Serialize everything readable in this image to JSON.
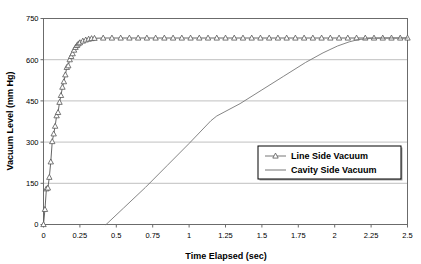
{
  "chart_data": {
    "type": "line",
    "title": "",
    "xlabel": "Time Elapsed (sec)",
    "ylabel": "Vacuum Level (mm Hg)",
    "xlim": [
      0,
      2.5
    ],
    "ylim": [
      0,
      750
    ],
    "xticks": [
      "0",
      "0.25",
      "0.5",
      "0.75",
      "1",
      "1.25",
      "1.5",
      "1.75",
      "2",
      "2.25",
      "2.5"
    ],
    "xtick_values": [
      0,
      0.25,
      0.5,
      0.75,
      1,
      1.25,
      1.5,
      1.75,
      2,
      2.25,
      2.5
    ],
    "yticks": [
      "0",
      "150",
      "300",
      "450",
      "600",
      "750"
    ],
    "ytick_values": [
      0,
      150,
      300,
      450,
      600,
      750
    ],
    "grid": "horizontal",
    "legend_position": "center-right",
    "series": [
      {
        "name": "Line Side Vacuum",
        "marker": "triangle-up",
        "color": "#555555",
        "x": [
          0.0,
          0.01,
          0.02,
          0.03,
          0.04,
          0.05,
          0.06,
          0.07,
          0.08,
          0.09,
          0.1,
          0.11,
          0.12,
          0.13,
          0.14,
          0.15,
          0.16,
          0.17,
          0.18,
          0.19,
          0.2,
          0.21,
          0.22,
          0.23,
          0.24,
          0.25,
          0.27,
          0.29,
          0.31,
          0.33,
          0.35,
          0.41,
          0.47,
          0.53,
          0.59,
          0.65,
          0.71,
          0.77,
          0.83,
          0.89,
          0.95,
          1.01,
          1.07,
          1.13,
          1.19,
          1.25,
          1.31,
          1.37,
          1.43,
          1.49,
          1.55,
          1.61,
          1.67,
          1.73,
          1.79,
          1.85,
          1.91,
          1.97,
          2.03,
          2.09,
          2.15,
          2.21,
          2.27,
          2.33,
          2.39,
          2.45,
          2.5
        ],
        "y": [
          0,
          55,
          130,
          133,
          172,
          228,
          302,
          330,
          358,
          396,
          408,
          445,
          470,
          500,
          520,
          545,
          572,
          578,
          600,
          612,
          622,
          635,
          645,
          652,
          658,
          662,
          668,
          672,
          675,
          677,
          678,
          679,
          679,
          679,
          679,
          679,
          679,
          679,
          679,
          679,
          679,
          679,
          679,
          679,
          679,
          679,
          679,
          679,
          679,
          679,
          679,
          679,
          679,
          679,
          679,
          679,
          679,
          679,
          679,
          679,
          679,
          679,
          679,
          679,
          679,
          679,
          679
        ]
      },
      {
        "name": "Cavity Side Vacuum",
        "marker": "none",
        "color": "#777777",
        "x": [
          0.43,
          0.55,
          0.7,
          0.85,
          1.0,
          1.15,
          1.19,
          1.35,
          1.5,
          1.65,
          1.8,
          1.92,
          2.02,
          2.1,
          2.16,
          2.25,
          2.35,
          2.45,
          2.5
        ],
        "y": [
          0,
          60,
          135,
          215,
          295,
          378,
          395,
          440,
          490,
          540,
          590,
          625,
          650,
          665,
          673,
          678,
          679,
          679,
          679
        ]
      }
    ]
  },
  "legend": {
    "entries": [
      {
        "label": "Line Side Vacuum",
        "marker": "triangle-up"
      },
      {
        "label": "Cavity Side Vacuum",
        "marker": "line"
      }
    ]
  }
}
